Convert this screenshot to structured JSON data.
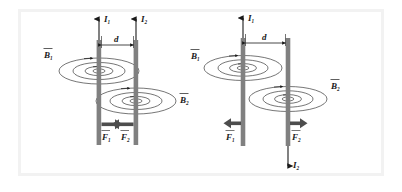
{
  "figure": {
    "frame_color": "#f2f2f2",
    "background_color": "#ffffff",
    "wire_color": "#808080",
    "line_color": "#1a1a1a",
    "arrow_color": "#4d4d4d"
  },
  "panels": [
    {
      "id": "left-panel",
      "description": "Parallel currents in the same direction: wires attract",
      "separation_label": "d",
      "wires": [
        {
          "id": "wire-1",
          "current_label": "I",
          "current_subscript": "1",
          "current_direction": "up",
          "field_label": "B",
          "field_subscript": "1",
          "force_label": "F",
          "force_subscript": "1",
          "force_direction": "right"
        },
        {
          "id": "wire-2",
          "current_label": "I",
          "current_subscript": "2",
          "current_direction": "up",
          "field_label": "B",
          "field_subscript": "2",
          "force_label": "F",
          "force_subscript": "2",
          "force_direction": "left"
        }
      ]
    },
    {
      "id": "right-panel",
      "description": "Antiparallel currents: wires repel",
      "separation_label": "d",
      "wires": [
        {
          "id": "wire-1",
          "current_label": "I",
          "current_subscript": "1",
          "current_direction": "up",
          "field_label": "B",
          "field_subscript": "1",
          "force_label": "F",
          "force_subscript": "1",
          "force_direction": "left"
        },
        {
          "id": "wire-2",
          "current_label": "I",
          "current_subscript": "2",
          "current_direction": "down",
          "field_label": "B",
          "field_subscript": "2",
          "force_label": "F",
          "force_subscript": "2",
          "force_direction": "right"
        }
      ]
    }
  ],
  "extra_labels": {
    "left_panel_b2_right": "B",
    "left_panel_b2_right_sub": "2",
    "right_panel_b2_left": "B",
    "right_panel_b2_left_sub": "2"
  }
}
